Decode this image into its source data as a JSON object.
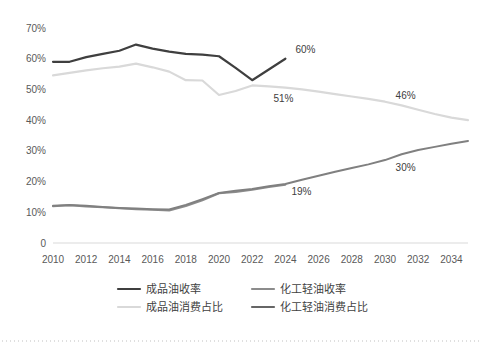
{
  "chart_data": {
    "type": "line",
    "title": "",
    "subtitle": "",
    "xlabel": "",
    "ylabel": "",
    "grid": false,
    "legend_position": "bottom",
    "x": [
      2010,
      2011,
      2012,
      2013,
      2014,
      2015,
      2016,
      2017,
      2018,
      2019,
      2020,
      2021,
      2022,
      2023,
      2024,
      2025,
      2026,
      2027,
      2028,
      2029,
      2030,
      2031,
      2032,
      2033,
      2034,
      2035
    ],
    "xtick_labels": [
      "2010",
      "2012",
      "2014",
      "2016",
      "2018",
      "2020",
      "2022",
      "2024",
      "2026",
      "2028",
      "2030",
      "2032",
      "2034"
    ],
    "xticks": [
      2010,
      2012,
      2014,
      2016,
      2018,
      2020,
      2022,
      2024,
      2026,
      2028,
      2030,
      2032,
      2034
    ],
    "ytick_labels": [
      "0",
      "10%",
      "20%",
      "30%",
      "40%",
      "50%",
      "60%",
      "70%"
    ],
    "yticks": [
      0,
      10,
      20,
      30,
      40,
      50,
      60,
      70
    ],
    "ylim": [
      0,
      72
    ],
    "xlim": [
      2010,
      2035
    ],
    "series": [
      {
        "name": "成品油收率",
        "color": "#3f3f3f",
        "width": 2.2,
        "values": [
          59.0,
          59.0,
          60.5,
          61.6,
          62.6,
          64.6,
          63.3,
          62.3,
          61.6,
          61.3,
          60.8,
          57.0,
          53.0,
          56.5,
          60.0,
          null,
          null,
          null,
          null,
          null,
          null,
          null,
          null,
          null,
          null,
          null
        ]
      },
      {
        "name": "化工轻油收率",
        "color": "#8c8c8c",
        "width": 2.0,
        "values": [
          12.0,
          12.3,
          11.9,
          11.6,
          11.3,
          11.0,
          10.8,
          10.6,
          12.0,
          13.9,
          16.2,
          16.6,
          17.3,
          18.2,
          19.0,
          null,
          null,
          null,
          null,
          null,
          null,
          null,
          null,
          null,
          null,
          null
        ]
      },
      {
        "name": "成品油消费占比",
        "color": "#d9d9d9",
        "width": 2.2,
        "values": [
          54.6,
          55.4,
          56.2,
          56.9,
          57.4,
          58.4,
          57.2,
          55.8,
          53.0,
          52.9,
          48.2,
          49.5,
          51.3,
          51.0,
          50.6,
          50.0,
          49.3,
          48.5,
          47.7,
          46.9,
          46.0,
          44.8,
          43.4,
          42.0,
          40.8,
          40.0
        ]
      },
      {
        "name": "化工轻油消费占比",
        "color": "#808080",
        "width": 2.0,
        "values": [
          12.1,
          12.4,
          12.1,
          11.7,
          11.4,
          11.2,
          11.0,
          10.9,
          12.4,
          14.3,
          16.3,
          17.0,
          17.6,
          18.5,
          19.2,
          20.6,
          21.9,
          23.2,
          24.4,
          25.6,
          27.0,
          28.9,
          30.3,
          31.3,
          32.3,
          33.2
        ]
      }
    ],
    "annotations": [
      {
        "text": "60%",
        "x": 2024,
        "y": 60.0,
        "dx": 10,
        "dy": -6
      },
      {
        "text": "51%",
        "x": 2024,
        "y": 50.6,
        "dx": -12,
        "dy": 14
      },
      {
        "text": "46%",
        "x": 2031,
        "y": 44.8,
        "dx": -6,
        "dy": -6
      },
      {
        "text": "19%",
        "x": 2024,
        "y": 19.2,
        "dx": 6,
        "dy": 11
      },
      {
        "text": "30%",
        "x": 2031,
        "y": 28.9,
        "dx": -6,
        "dy": 17
      }
    ]
  },
  "legend": {
    "items": [
      {
        "label": "成品油收率",
        "color": "#3f3f3f"
      },
      {
        "label": "化工轻油收率",
        "color": "#8c8c8c"
      },
      {
        "label": "成品油消费占比",
        "color": "#d9d9d9"
      },
      {
        "label": "化工轻油消费占比",
        "color": "#666666"
      }
    ]
  },
  "colors": {
    "axis": "#d9d9d9",
    "tick_text": "#595959",
    "label_text": "#404040",
    "background": "#ffffff"
  }
}
